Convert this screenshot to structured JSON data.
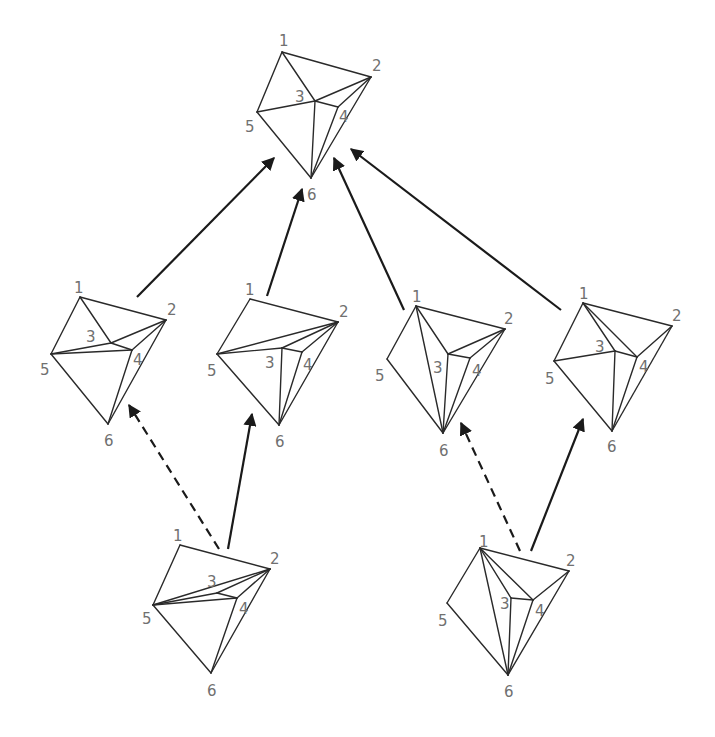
{
  "diagram": {
    "title": "",
    "line_color": "#2a2a2a",
    "arrow_color": "#1a1a1a",
    "label_color": "#707070",
    "polyhedra": [
      {
        "id": "top",
        "vertices": {
          "1": {
            "x": 282,
            "y": 52,
            "lx": 279,
            "ly": 46
          },
          "2": {
            "x": 371,
            "y": 77,
            "lx": 372,
            "ly": 71
          },
          "3": {
            "x": 315,
            "y": 101,
            "lx": 295,
            "ly": 102
          },
          "4": {
            "x": 338,
            "y": 107,
            "lx": 339,
            "ly": 122
          },
          "5": {
            "x": 257,
            "y": 112,
            "lx": 245,
            "ly": 132
          },
          "6": {
            "x": 311,
            "y": 178,
            "lx": 307,
            "ly": 200
          }
        },
        "edges": [
          [
            "1",
            "2"
          ],
          [
            "1",
            "5"
          ],
          [
            "1",
            "3"
          ],
          [
            "5",
            "3"
          ],
          [
            "3",
            "2"
          ],
          [
            "3",
            "4"
          ],
          [
            "4",
            "2"
          ],
          [
            "2",
            "6"
          ],
          [
            "3",
            "6"
          ],
          [
            "4",
            "6"
          ],
          [
            "5",
            "6"
          ]
        ]
      },
      {
        "id": "mid-1",
        "vertices": {
          "1": {
            "x": 80,
            "y": 297,
            "lx": 74,
            "ly": 293
          },
          "2": {
            "x": 166,
            "y": 320,
            "lx": 167,
            "ly": 315
          },
          "3": {
            "x": 111,
            "y": 343,
            "lx": 86,
            "ly": 342
          },
          "4": {
            "x": 132,
            "y": 350,
            "lx": 133,
            "ly": 365
          },
          "5": {
            "x": 51,
            "y": 354,
            "lx": 40,
            "ly": 375
          },
          "6": {
            "x": 108,
            "y": 424,
            "lx": 104,
            "ly": 446
          }
        },
        "edges": [
          [
            "1",
            "2"
          ],
          [
            "1",
            "5"
          ],
          [
            "1",
            "3"
          ],
          [
            "3",
            "2"
          ],
          [
            "5",
            "3"
          ],
          [
            "5",
            "4"
          ],
          [
            "3",
            "4"
          ],
          [
            "4",
            "2"
          ],
          [
            "2",
            "6"
          ],
          [
            "4",
            "6"
          ],
          [
            "5",
            "6"
          ]
        ]
      },
      {
        "id": "mid-2",
        "vertices": {
          "1": {
            "x": 250,
            "y": 299,
            "lx": 245,
            "ly": 295
          },
          "2": {
            "x": 338,
            "y": 322,
            "lx": 339,
            "ly": 317
          },
          "3": {
            "x": 282,
            "y": 348,
            "lx": 265,
            "ly": 368
          },
          "4": {
            "x": 302,
            "y": 352,
            "lx": 303,
            "ly": 370
          },
          "5": {
            "x": 217,
            "y": 354,
            "lx": 207,
            "ly": 376
          },
          "6": {
            "x": 279,
            "y": 425,
            "lx": 275,
            "ly": 447
          }
        },
        "edges": [
          [
            "1",
            "2"
          ],
          [
            "1",
            "5"
          ],
          [
            "5",
            "2"
          ],
          [
            "5",
            "3"
          ],
          [
            "3",
            "2"
          ],
          [
            "3",
            "4"
          ],
          [
            "4",
            "2"
          ],
          [
            "3",
            "6"
          ],
          [
            "4",
            "6"
          ],
          [
            "2",
            "6"
          ],
          [
            "5",
            "6"
          ]
        ]
      },
      {
        "id": "mid-3",
        "vertices": {
          "1": {
            "x": 416,
            "y": 306,
            "lx": 412,
            "ly": 302
          },
          "2": {
            "x": 505,
            "y": 329,
            "lx": 504,
            "ly": 324
          },
          "3": {
            "x": 448,
            "y": 354,
            "lx": 433,
            "ly": 373
          },
          "4": {
            "x": 470,
            "y": 358,
            "lx": 472,
            "ly": 376
          },
          "5": {
            "x": 387,
            "y": 359,
            "lx": 375,
            "ly": 381
          },
          "6": {
            "x": 443,
            "y": 433,
            "lx": 439,
            "ly": 456
          }
        },
        "edges": [
          [
            "1",
            "2"
          ],
          [
            "1",
            "5"
          ],
          [
            "1",
            "3"
          ],
          [
            "1",
            "6"
          ],
          [
            "3",
            "2"
          ],
          [
            "3",
            "4"
          ],
          [
            "4",
            "2"
          ],
          [
            "3",
            "6"
          ],
          [
            "4",
            "6"
          ],
          [
            "2",
            "6"
          ],
          [
            "5",
            "6"
          ]
        ]
      },
      {
        "id": "mid-4",
        "vertices": {
          "1": {
            "x": 583,
            "y": 303,
            "lx": 579,
            "ly": 299
          },
          "2": {
            "x": 672,
            "y": 326,
            "lx": 672,
            "ly": 321
          },
          "3": {
            "x": 615,
            "y": 351,
            "lx": 595,
            "ly": 352
          },
          "4": {
            "x": 637,
            "y": 357,
            "lx": 639,
            "ly": 372
          },
          "5": {
            "x": 554,
            "y": 361,
            "lx": 545,
            "ly": 384
          },
          "6": {
            "x": 612,
            "y": 431,
            "lx": 607,
            "ly": 452
          }
        },
        "edges": [
          [
            "1",
            "2"
          ],
          [
            "1",
            "5"
          ],
          [
            "1",
            "3"
          ],
          [
            "1",
            "4"
          ],
          [
            "2",
            "4"
          ],
          [
            "3",
            "4"
          ],
          [
            "5",
            "3"
          ],
          [
            "3",
            "6"
          ],
          [
            "4",
            "6"
          ],
          [
            "2",
            "6"
          ],
          [
            "5",
            "6"
          ]
        ]
      },
      {
        "id": "bottom-1",
        "vertices": {
          "1": {
            "x": 180,
            "y": 545,
            "lx": 173,
            "ly": 541
          },
          "2": {
            "x": 270,
            "y": 569,
            "lx": 270,
            "ly": 564
          },
          "3": {
            "x": 217,
            "y": 593,
            "lx": 207,
            "ly": 587
          },
          "4": {
            "x": 237,
            "y": 598,
            "lx": 239,
            "ly": 614
          },
          "5": {
            "x": 153,
            "y": 605,
            "lx": 142,
            "ly": 624
          },
          "6": {
            "x": 211,
            "y": 673,
            "lx": 207,
            "ly": 696
          }
        },
        "edges": [
          [
            "1",
            "2"
          ],
          [
            "1",
            "5"
          ],
          [
            "5",
            "2"
          ],
          [
            "5",
            "3"
          ],
          [
            "5",
            "4"
          ],
          [
            "3",
            "2"
          ],
          [
            "3",
            "4"
          ],
          [
            "4",
            "2"
          ],
          [
            "4",
            "6"
          ],
          [
            "2",
            "6"
          ],
          [
            "5",
            "6"
          ]
        ]
      },
      {
        "id": "bottom-2",
        "vertices": {
          "1": {
            "x": 480,
            "y": 548,
            "lx": 479,
            "ly": 547
          },
          "2": {
            "x": 569,
            "y": 571,
            "lx": 566,
            "ly": 566
          },
          "3": {
            "x": 511,
            "y": 598,
            "lx": 500,
            "ly": 609
          },
          "4": {
            "x": 533,
            "y": 600,
            "lx": 535,
            "ly": 616
          },
          "5": {
            "x": 447,
            "y": 603,
            "lx": 438,
            "ly": 626
          },
          "6": {
            "x": 508,
            "y": 675,
            "lx": 504,
            "ly": 697
          }
        },
        "edges": [
          [
            "1",
            "2"
          ],
          [
            "1",
            "5"
          ],
          [
            "1",
            "3"
          ],
          [
            "1",
            "4"
          ],
          [
            "1",
            "6"
          ],
          [
            "3",
            "4"
          ],
          [
            "4",
            "2"
          ],
          [
            "3",
            "6"
          ],
          [
            "4",
            "6"
          ],
          [
            "2",
            "6"
          ],
          [
            "5",
            "6"
          ]
        ]
      }
    ],
    "arrows": [
      {
        "from": "mid-1",
        "to": "top",
        "style": "solid",
        "x1": 137,
        "y1": 297,
        "x2": 274,
        "y2": 158
      },
      {
        "from": "mid-2",
        "to": "top",
        "style": "solid",
        "x1": 267,
        "y1": 296,
        "x2": 302,
        "y2": 189
      },
      {
        "from": "mid-3",
        "to": "top",
        "style": "solid",
        "x1": 404,
        "y1": 310,
        "x2": 334,
        "y2": 158
      },
      {
        "from": "mid-4",
        "to": "top",
        "style": "solid",
        "x1": 561,
        "y1": 310,
        "x2": 351,
        "y2": 149
      },
      {
        "from": "bottom-1",
        "to": "mid-1",
        "style": "dashed",
        "x1": 219,
        "y1": 549,
        "x2": 129,
        "y2": 405
      },
      {
        "from": "bottom-1",
        "to": "mid-2",
        "style": "solid",
        "x1": 228,
        "y1": 549,
        "x2": 252,
        "y2": 414
      },
      {
        "from": "bottom-2",
        "to": "mid-3",
        "style": "dashed",
        "x1": 520,
        "y1": 551,
        "x2": 461,
        "y2": 423
      },
      {
        "from": "bottom-2",
        "to": "mid-4",
        "style": "solid",
        "x1": 531,
        "y1": 551,
        "x2": 583,
        "y2": 419
      }
    ]
  }
}
